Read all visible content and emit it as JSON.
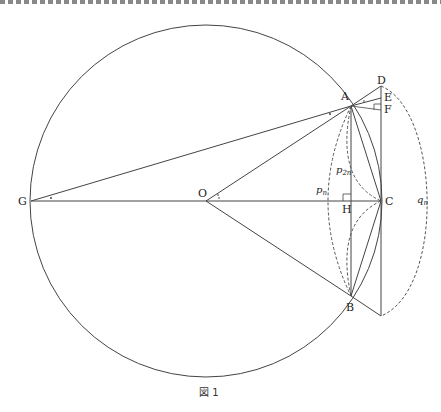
{
  "figure": {
    "caption": "図 1",
    "points": {
      "A": "A",
      "B": "B",
      "C": "C",
      "D": "D",
      "E": "E",
      "F": "F",
      "G": "G",
      "H": "H",
      "O": "O"
    },
    "arc_labels": {
      "pn": "p",
      "pn_sub": "n",
      "p2n": "p",
      "p2n_sub": "2n",
      "qn": "q",
      "qn_sub": "n"
    }
  },
  "colors": {
    "line": "#444444",
    "dashed": "#555555",
    "border": "#888888"
  }
}
